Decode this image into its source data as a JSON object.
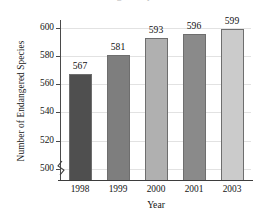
{
  "chart_data": {
    "type": "bar",
    "title": "",
    "xlabel": "Year",
    "ylabel": "Number of Endangered Species",
    "categories": [
      "1998",
      "1999",
      "2000",
      "2001",
      "2003"
    ],
    "values": [
      567,
      581,
      593,
      596,
      599
    ],
    "value_labels": [
      "567",
      "581",
      "593",
      "596",
      "599"
    ],
    "ylim": [
      492,
      605
    ],
    "ytick_labels": [
      "500",
      "520",
      "540",
      "560",
      "580",
      "600"
    ],
    "ytick_values": [
      500,
      520,
      540,
      560,
      580,
      600
    ],
    "grid": true,
    "grid_axis": "y",
    "legend": "none",
    "axis_break": true,
    "axis_break_note": "y-axis truncated below 500",
    "bar_colors": [
      "#4f4f4f",
      "#7e7e7e",
      "#b0b0b0",
      "#8a8a8a",
      "#cbcbcb"
    ],
    "bar_border_color": "#6e6e6e",
    "axis_color": "#3d3d3d",
    "gridline_color": "#e2e2e2",
    "background_color": "#ffffff"
  },
  "figure": {
    "cutoff_title_sliver": "Endangered Species"
  }
}
